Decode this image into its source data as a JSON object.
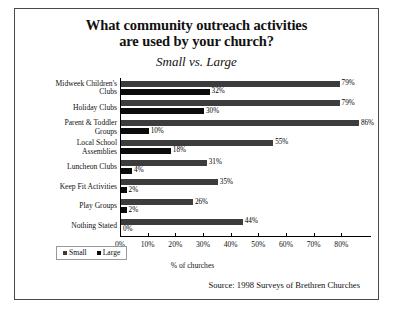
{
  "title_line1": "What community outreach activities",
  "title_line2": "are used by your church?",
  "subtitle": "Small vs. Large",
  "xaxis_title": "% of churches",
  "source": "Source: 1998 Surveys of Brethren Churches",
  "legend": {
    "small": "Small",
    "large": "Large"
  },
  "colors": {
    "small": "#3c3c3c",
    "large": "#0b0b0b",
    "frame": "#4a4a4a"
  },
  "chart_data": {
    "type": "bar",
    "orientation": "horizontal",
    "title": "What community outreach activities are used by your church?",
    "subtitle": "Small vs. Large",
    "xlabel": "% of churches",
    "ylabel": "",
    "xlim": [
      0,
      90
    ],
    "grid": false,
    "legend_position": "bottom-left",
    "categories": [
      "Midweek Children's Clubs",
      "Holiday Clubs",
      "Parent & Toddler Groups",
      "Local School Assemblies",
      "Luncheon Clubs",
      "Keep Fit Activities",
      "Play Groups",
      "Nothing Stated"
    ],
    "tick_labels": [
      "0%",
      "10%",
      "20%",
      "30%",
      "40%",
      "50%",
      "60%",
      "70%",
      "80%"
    ],
    "tick_values": [
      0,
      10,
      20,
      30,
      40,
      50,
      60,
      70,
      80
    ],
    "series": [
      {
        "name": "Small",
        "values": [
          79,
          79,
          86,
          55,
          31,
          35,
          26,
          44
        ],
        "labels": [
          "79%",
          "79%",
          "86%",
          "55%",
          "31%",
          "35%",
          "26%",
          "44%"
        ]
      },
      {
        "name": "Large",
        "values": [
          32,
          30,
          10,
          18,
          4,
          2,
          2,
          0
        ],
        "labels": [
          "32%",
          "30%",
          "10%",
          "18%",
          "4%",
          "2%",
          "2%",
          "0%"
        ]
      }
    ]
  }
}
